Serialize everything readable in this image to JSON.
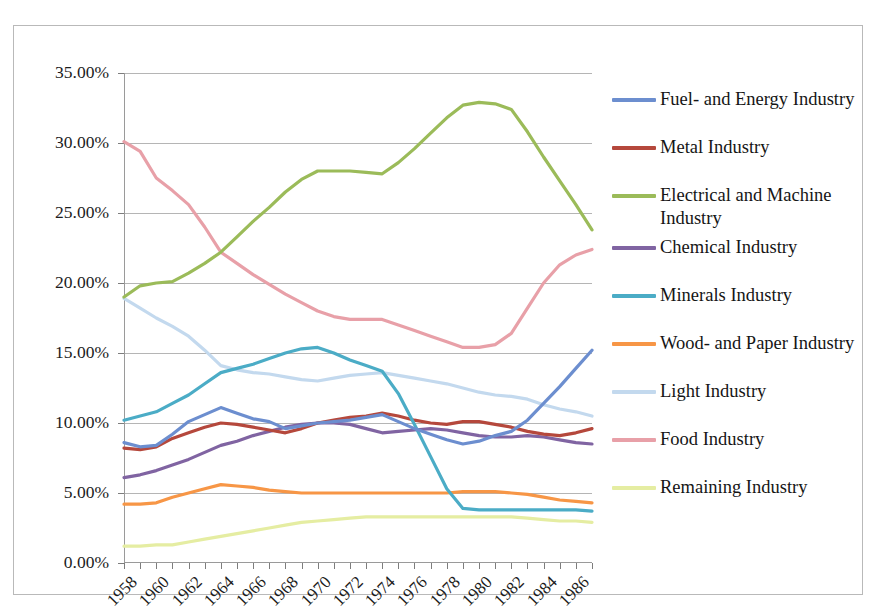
{
  "chart_data": {
    "type": "line",
    "title": "",
    "subtitle": "",
    "xlabel": "",
    "ylabel": "",
    "xlim": [
      1958,
      1987
    ],
    "ylim": [
      0,
      35
    ],
    "grid": true,
    "legend_position": "right",
    "y_tick_labels": [
      "0.00%",
      "5.00%",
      "10.00%",
      "15.00%",
      "20.00%",
      "25.00%",
      "30.00%",
      "35.00%"
    ],
    "y_tick_values": [
      0,
      5,
      10,
      15,
      20,
      25,
      30,
      35
    ],
    "x_tick_labels": [
      "1958",
      "1960",
      "1962",
      "1964",
      "1966",
      "1968",
      "1970",
      "1972",
      "1974",
      "1976",
      "1978",
      "1980",
      "1982",
      "1984",
      "1986"
    ],
    "x": [
      1958,
      1959,
      1960,
      1961,
      1962,
      1963,
      1964,
      1965,
      1966,
      1967,
      1968,
      1969,
      1970,
      1971,
      1972,
      1973,
      1974,
      1975,
      1976,
      1977,
      1978,
      1979,
      1980,
      1981,
      1982,
      1983,
      1984,
      1985,
      1986,
      1987
    ],
    "series": [
      {
        "name": "Fuel- and Energy Industry",
        "color": "#6c8ecf",
        "values": [
          8.6,
          8.3,
          8.4,
          9.2,
          10.1,
          10.6,
          11.1,
          10.7,
          10.3,
          10.1,
          9.6,
          9.8,
          10.0,
          10.1,
          10.2,
          10.4,
          10.6,
          10.1,
          9.6,
          9.2,
          8.8,
          8.5,
          8.7,
          9.1,
          9.4,
          10.2,
          11.4,
          12.6,
          13.9,
          15.2
        ]
      },
      {
        "name": "Metal Industry",
        "color": "#b5483c"
      },
      {
        "name": "Electrical and Machine Industry",
        "color": "#9bbb59"
      },
      {
        "name": "Chemical Industry",
        "color": "#8064a2"
      },
      {
        "name": "Minerals Industry",
        "color": "#4bacc6"
      },
      {
        "name": "Wood- and Paper Industry",
        "color": "#f79646"
      },
      {
        "name": "Light Industry",
        "color": "#c3d9ee"
      },
      {
        "name": "Food Industry",
        "color": "#e8a0a8"
      },
      {
        "name": "Remaining Industry",
        "color": "#e5eda2"
      }
    ],
    "series_values": {
      "Fuel- and Energy Industry": [
        8.6,
        8.3,
        8.4,
        9.2,
        10.1,
        10.6,
        11.1,
        10.7,
        10.3,
        10.1,
        9.6,
        9.8,
        10.0,
        10.1,
        10.2,
        10.4,
        10.6,
        10.1,
        9.6,
        9.2,
        8.8,
        8.5,
        8.7,
        9.1,
        9.4,
        10.2,
        11.4,
        12.6,
        13.9,
        15.2
      ],
      "Metal Industry": [
        8.2,
        8.1,
        8.3,
        8.9,
        9.3,
        9.7,
        10.0,
        9.9,
        9.7,
        9.5,
        9.3,
        9.6,
        10.0,
        10.2,
        10.4,
        10.5,
        10.7,
        10.5,
        10.2,
        10.0,
        9.9,
        10.1,
        10.1,
        9.9,
        9.7,
        9.4,
        9.2,
        9.1,
        9.3,
        9.6
      ],
      "Electrical and Machine Industry": [
        19.0,
        19.8,
        20.0,
        20.1,
        20.7,
        21.4,
        22.2,
        23.3,
        24.4,
        25.4,
        26.5,
        27.4,
        28.0,
        28.0,
        28.0,
        27.9,
        27.8,
        28.6,
        29.6,
        30.7,
        31.8,
        32.7,
        32.9,
        32.8,
        32.4,
        30.8,
        29.0,
        27.3,
        25.6,
        23.8
      ],
      "Chemical Industry": [
        6.1,
        6.3,
        6.6,
        7.0,
        7.4,
        7.9,
        8.4,
        8.7,
        9.1,
        9.4,
        9.7,
        9.9,
        10.0,
        10.0,
        9.9,
        9.6,
        9.3,
        9.4,
        9.5,
        9.6,
        9.5,
        9.3,
        9.1,
        9.0,
        9.0,
        9.1,
        9.0,
        8.8,
        8.6,
        8.5
      ],
      "Minerals Industry": [
        10.2,
        10.5,
        10.8,
        11.4,
        12.0,
        12.8,
        13.6,
        13.9,
        14.2,
        14.6,
        15.0,
        15.3,
        15.4,
        15.0,
        14.5,
        14.1,
        13.7,
        12.1,
        9.9,
        7.6,
        5.3,
        3.9,
        3.8,
        3.8,
        3.8,
        3.8,
        3.8,
        3.8,
        3.8,
        3.7
      ],
      "Wood- and Paper Industry": [
        4.2,
        4.2,
        4.3,
        4.7,
        5.0,
        5.3,
        5.6,
        5.5,
        5.4,
        5.2,
        5.1,
        5.0,
        5.0,
        5.0,
        5.0,
        5.0,
        5.0,
        5.0,
        5.0,
        5.0,
        5.0,
        5.1,
        5.1,
        5.1,
        5.0,
        4.9,
        4.7,
        4.5,
        4.4,
        4.3
      ],
      "Light Industry": [
        18.9,
        18.2,
        17.5,
        16.9,
        16.2,
        15.2,
        14.1,
        13.8,
        13.6,
        13.5,
        13.3,
        13.1,
        13.0,
        13.2,
        13.4,
        13.5,
        13.6,
        13.4,
        13.2,
        13.0,
        12.8,
        12.5,
        12.2,
        12.0,
        11.9,
        11.7,
        11.3,
        11.0,
        10.8,
        10.5
      ],
      "Food Industry": [
        30.1,
        29.4,
        27.5,
        26.6,
        25.6,
        24.0,
        22.2,
        21.4,
        20.6,
        19.9,
        19.2,
        18.6,
        18.0,
        17.6,
        17.4,
        17.4,
        17.4,
        17.0,
        16.6,
        16.2,
        15.8,
        15.4,
        15.4,
        15.6,
        16.4,
        18.2,
        20.0,
        21.3,
        22.0,
        22.4
      ],
      "Remaining Industry": [
        1.2,
        1.2,
        1.3,
        1.3,
        1.5,
        1.7,
        1.9,
        2.1,
        2.3,
        2.5,
        2.7,
        2.9,
        3.0,
        3.1,
        3.2,
        3.3,
        3.3,
        3.3,
        3.3,
        3.3,
        3.3,
        3.3,
        3.3,
        3.3,
        3.3,
        3.2,
        3.1,
        3.0,
        3.0,
        2.9
      ]
    }
  },
  "legend": {
    "items": [
      {
        "label": "Fuel- and Energy Industry",
        "color": "#6c8ecf"
      },
      {
        "label": "Metal Industry",
        "color": "#b5483c"
      },
      {
        "label": "Electrical and Machine Industry",
        "color": "#9bbb59"
      },
      {
        "label": "Chemical Industry",
        "color": "#8064a2"
      },
      {
        "label": "Minerals Industry",
        "color": "#4bacc6"
      },
      {
        "label": "Wood- and Paper Industry",
        "color": "#f79646"
      },
      {
        "label": "Light Industry",
        "color": "#c3d9ee"
      },
      {
        "label": "Food Industry",
        "color": "#e8a0a8"
      },
      {
        "label": "Remaining Industry",
        "color": "#e5eda2"
      }
    ]
  }
}
